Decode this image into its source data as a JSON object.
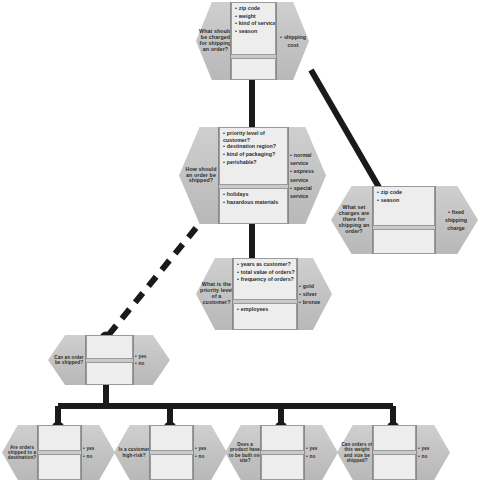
{
  "diagram": {
    "type": "decision-requirements-diagram",
    "colors": {
      "node_fill": "#c9c9c9",
      "cell_fill": "#ededed",
      "border": "#8a8a8a",
      "connector": "#1a1a1a",
      "background": "#ffffff"
    }
  },
  "nodes": [
    {
      "id": "shipping-charge",
      "question": "What should be charged for shipping an order?",
      "inputs_top": [
        "zip code",
        "weight",
        "kind of service",
        "season"
      ],
      "inputs_bottom": [],
      "outputs": [
        "shipping cost"
      ],
      "outputs_bulleted": false
    },
    {
      "id": "how-shipped",
      "question": "How should an order be shipped?",
      "inputs_top": [
        "priority level of customer?",
        "destination region?",
        "kind of packaging?",
        "perishable?"
      ],
      "inputs_bottom": [
        "holidays",
        "hazardous materials"
      ],
      "outputs": [
        "normal service",
        "express service",
        "special service"
      ],
      "outputs_bulleted": true
    },
    {
      "id": "set-charges",
      "question": "What set charges are there for shipping an order?",
      "inputs_top": [
        "zip code",
        "season"
      ],
      "inputs_bottom": [],
      "outputs": [
        "fixed shipping charge"
      ],
      "outputs_bulleted": false
    },
    {
      "id": "priority-level",
      "question": "What is the priority level of a customer?",
      "inputs_top": [
        "years as customer?",
        "total value of orders?",
        "frequency of orders?"
      ],
      "inputs_bottom": [
        "employees"
      ],
      "outputs": [
        "gold",
        "silver",
        "bronze"
      ],
      "outputs_bulleted": true
    },
    {
      "id": "can-order-be-shipped",
      "question": "Can an order be shipped?",
      "inputs_top": [],
      "inputs_bottom": [],
      "outputs": [
        "yes",
        "no"
      ],
      "outputs_bulleted": true
    },
    {
      "id": "orders-to-destination",
      "question": "Are orders shipped to a destination?",
      "inputs_top": [],
      "inputs_bottom": [],
      "outputs": [
        "yes",
        "no"
      ],
      "outputs_bulleted": true
    },
    {
      "id": "customer-high-risk",
      "question": "Is a customer high-risk?",
      "inputs_top": [],
      "inputs_bottom": [],
      "outputs": [
        "yes",
        "no"
      ],
      "outputs_bulleted": true
    },
    {
      "id": "built-on-site",
      "question": "Does a product have to be built on-site?",
      "inputs_top": [],
      "inputs_bottom": [],
      "outputs": [
        "yes",
        "no"
      ],
      "outputs_bulleted": true
    },
    {
      "id": "weight-and-size",
      "question": "Can orders of this weight and size be shipped?",
      "inputs_top": [],
      "inputs_bottom": [],
      "outputs": [
        "yes",
        "no"
      ],
      "outputs_bulleted": true
    }
  ],
  "connectors": [
    {
      "from": "shipping-charge",
      "to": "how-shipped",
      "style": "solid"
    },
    {
      "from": "shipping-charge",
      "to": "set-charges",
      "style": "solid"
    },
    {
      "from": "how-shipped",
      "to": "priority-level",
      "style": "solid"
    },
    {
      "from": "how-shipped",
      "to": "can-order-be-shipped",
      "style": "dashed"
    },
    {
      "from": "can-order-be-shipped",
      "to": "orders-to-destination",
      "style": "solid"
    },
    {
      "from": "can-order-be-shipped",
      "to": "customer-high-risk",
      "style": "solid"
    },
    {
      "from": "can-order-be-shipped",
      "to": "built-on-site",
      "style": "solid"
    },
    {
      "from": "can-order-be-shipped",
      "to": "weight-and-size",
      "style": "solid"
    }
  ]
}
